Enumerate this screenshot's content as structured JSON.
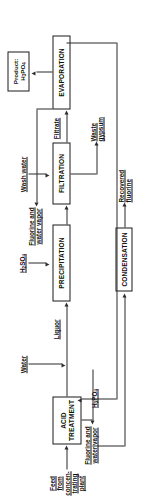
{
  "diagram": {
    "orientation": "rotated-90",
    "units": [
      {
        "id": "acid-treatment",
        "label": "ACID\nTREATMENT"
      },
      {
        "id": "precipitation",
        "label": "PRECIPITATION"
      },
      {
        "id": "filtration",
        "label": "FILTRATION"
      },
      {
        "id": "evaporation",
        "label": "EVAPORATION"
      },
      {
        "id": "condensation",
        "label": "CONDENSATION"
      }
    ],
    "streams": {
      "feed": "Feed from\nconcen-\ntrating\nplant",
      "water": "Water",
      "sulfuric_acid": "H2SO4",
      "liquor": "Liquor",
      "wash_water": "Wash water",
      "waste_gypsum": "Waste\ngypsum",
      "filtrate": "Filtrate",
      "fluorine_vapor_1": "Fluorine and\nwater vapor",
      "fluorine_vapor_2": "Fluorine and\nwater vapor",
      "recovered_fluorine": "Recovered\nfluorine",
      "recycle_acid": "H3PO4",
      "product": "Product:\nH3PO4"
    },
    "colors": {
      "line": "#2b2b2b",
      "box_border": "#1a1a1a",
      "background": "#ffffff",
      "text": "#111111"
    }
  }
}
